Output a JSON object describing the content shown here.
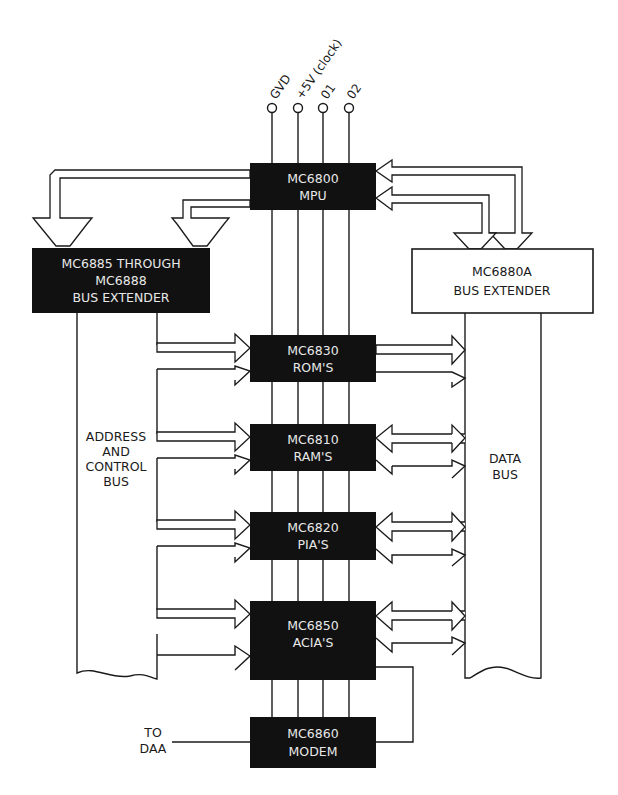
{
  "diagram": {
    "type": "block-diagram",
    "colors": {
      "chip_fill": "#111111",
      "chip_text": "#e8e8e8",
      "line": "#1a1a1a",
      "background": "#ffffff"
    },
    "pins": [
      {
        "id": "gnd",
        "label": "GVD"
      },
      {
        "id": "vcc",
        "label": "+5V (clock)"
      },
      {
        "id": "phi1",
        "label": "01"
      },
      {
        "id": "phi2",
        "label": "02"
      }
    ],
    "blocks": {
      "mpu": {
        "line1": "MC6800",
        "line2": "MPU"
      },
      "addr_extender": {
        "line1": "MC6885 THROUGH",
        "line2": "MC6888",
        "line3": "BUS EXTENDER"
      },
      "data_extender": {
        "line1": "MC6880A",
        "line2": "BUS EXTENDER"
      },
      "rom": {
        "line1": "MC6830",
        "line2": "ROM'S"
      },
      "ram": {
        "line1": "MC6810",
        "line2": "RAM'S"
      },
      "pia": {
        "line1": "MC6820",
        "line2": "PIA'S"
      },
      "acia": {
        "line1": "MC6850",
        "line2": "ACIA'S"
      },
      "modem": {
        "line1": "MC6860",
        "line2": "MODEM"
      }
    },
    "buses": {
      "address": {
        "line1": "ADDRESS",
        "line2": "AND",
        "line3": "CONTROL",
        "line4": "BUS"
      },
      "data": {
        "line1": "DATA",
        "line2": "BUS"
      }
    },
    "external": {
      "daa": {
        "line1": "TO",
        "line2": "DAA"
      }
    }
  }
}
